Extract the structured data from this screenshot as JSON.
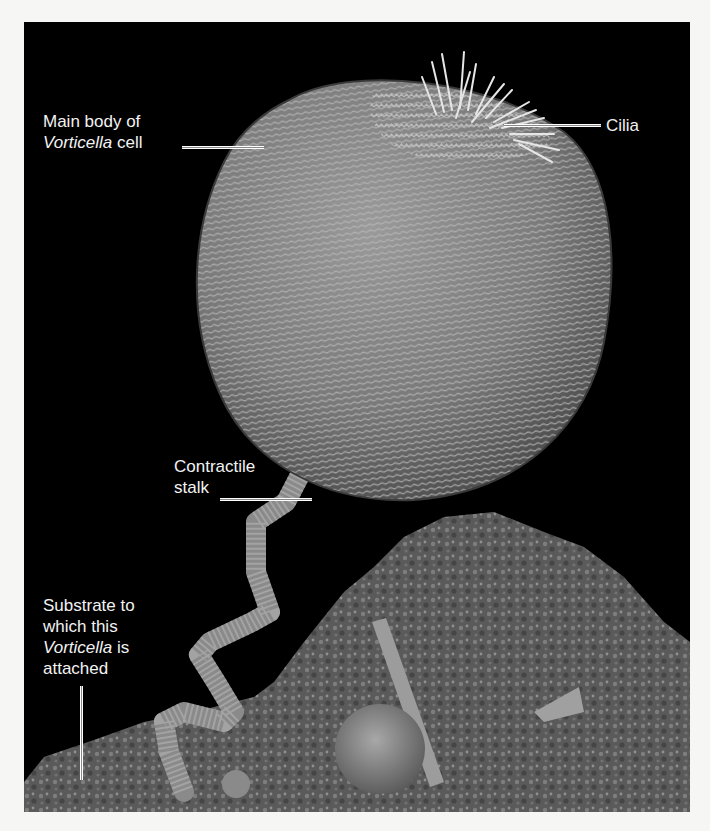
{
  "figure": {
    "background_color": "#000000",
    "page_color": "#f6f6f4",
    "label_color": "#f2f2f2",
    "specimen_tone": "#8c8c8c"
  },
  "labels": {
    "main_body": {
      "line1": "Main body of",
      "line2_italic": "Vorticella",
      "line2_rest": " cell"
    },
    "cilia": {
      "text": "Cilia"
    },
    "stalk": {
      "line1": "Contractile",
      "line2": "stalk"
    },
    "substrate": {
      "line1": "Substrate to",
      "line2": "which this",
      "line3_italic": "Vorticella",
      "line3_rest": " is",
      "line4": "attached"
    }
  }
}
